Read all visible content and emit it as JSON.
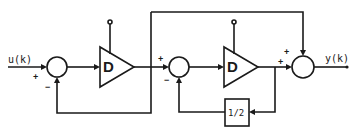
{
  "diagram": {
    "input_label": "u(k)",
    "output_label": "y(k)",
    "summer1": {
      "sign_input": "+",
      "sign_feedback": "−"
    },
    "delay1": {
      "label": "D"
    },
    "summer2": {
      "sign_input": "+",
      "sign_feedback": "−"
    },
    "delay2": {
      "label": "D"
    },
    "gain": {
      "label": "1/2"
    },
    "summer3": {
      "sign_top": "+",
      "sign_left": "+"
    }
  }
}
